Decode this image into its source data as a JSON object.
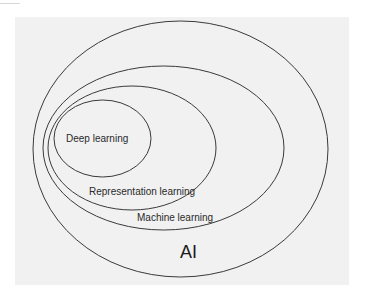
{
  "diagram": {
    "type": "nested-ellipses (euler diagram)",
    "colors": {
      "page_background": "#ffffff",
      "panel_background": "#f1f1f1",
      "stroke": "#3a3a3a",
      "text": "#2a2a2a"
    },
    "sets": [
      {
        "id": "ai",
        "label": "AI",
        "contains": [
          "machine-learning"
        ]
      },
      {
        "id": "machine-learning",
        "label": "Machine learning",
        "contains": [
          "representation-learning"
        ]
      },
      {
        "id": "representation-learning",
        "label": "Representation learning",
        "contains": [
          "deep-learning"
        ]
      },
      {
        "id": "deep-learning",
        "label": "Deep learning",
        "contains": []
      }
    ],
    "labels": {
      "deep": "Deep learning",
      "representation": "Representation learning",
      "machine": "Machine learning",
      "ai": "AI"
    }
  }
}
